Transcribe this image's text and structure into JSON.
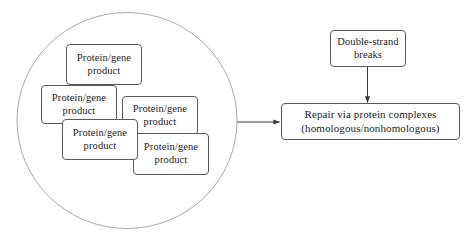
{
  "figure": {
    "cluster": {
      "name": "protein-gene-product-cluster",
      "shape": "circle",
      "nodes": [
        {
          "id": "pg1",
          "label": "Protein/gene product",
          "line1": "Protein/gene",
          "line2": "product"
        },
        {
          "id": "pg2",
          "label": "Protein/gene product",
          "line1": "Protein/gene",
          "line2": "product"
        },
        {
          "id": "pg3",
          "label": "Protein/gene product",
          "line1": "Protein/gene",
          "line2": "product"
        },
        {
          "id": "pg4",
          "label": "Protein/gene product",
          "line1": "Protein/gene",
          "line2": "product"
        },
        {
          "id": "pg5",
          "label": "Protein/gene product",
          "line1": "Protein/gene",
          "line2": "product"
        }
      ]
    },
    "damage_node": {
      "id": "double-strand-breaks",
      "line1": "Double-strand",
      "line2": "breaks"
    },
    "repair_node": {
      "id": "repair-via-protein-complexes",
      "line1": "Repair via protein complexes",
      "line2": "(homologous/nonhomologous)"
    },
    "arrows": [
      {
        "id": "arrow-cluster-to-repair",
        "from": "protein-gene-product-cluster",
        "to": "repair-via-protein-complexes",
        "direction": "right"
      },
      {
        "id": "arrow-breaks-to-repair",
        "from": "double-strand-breaks",
        "to": "repair-via-protein-complexes",
        "direction": "down"
      }
    ],
    "colors": {
      "box_border": "#59595b",
      "circle_border": "#aaaaac",
      "text": "#1c1c1c",
      "arrow": "#3a3a3c",
      "background": "#ffffff"
    }
  }
}
